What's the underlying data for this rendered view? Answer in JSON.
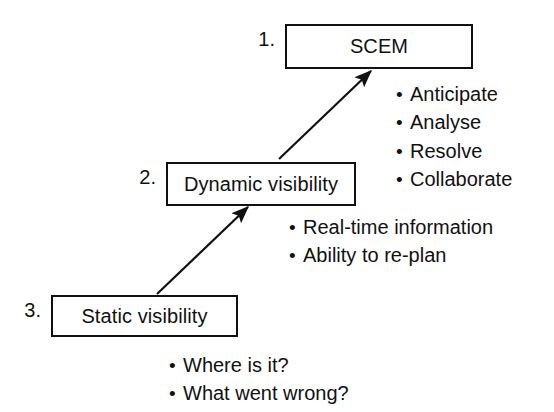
{
  "diagram": {
    "type": "flow-escalation",
    "background_color": "#ffffff",
    "line_color": "#111111",
    "text_color": "#111111",
    "nodes": [
      {
        "step": "1.",
        "label": "SCEM",
        "box": {
          "x": 285,
          "y": 24,
          "w": 188,
          "h": 45
        },
        "step_pos": {
          "x": 240,
          "y": 28
        }
      },
      {
        "step": "2.",
        "label": "Dynamic visibility",
        "box": {
          "x": 166,
          "y": 162,
          "w": 190,
          "h": 44
        },
        "step_pos": {
          "x": 122,
          "y": 166
        }
      },
      {
        "step": "3.",
        "label": "Static visibility",
        "box": {
          "x": 51,
          "y": 295,
          "w": 187,
          "h": 42
        },
        "step_pos": {
          "x": 6,
          "y": 299
        }
      }
    ],
    "arrows": [
      {
        "from": "Dynamic visibility",
        "to": "SCEM",
        "x1": 279,
        "y1": 159,
        "x2": 371,
        "y2": 71
      },
      {
        "from": "Static visibility",
        "to": "Dynamic visibility",
        "x1": 157,
        "y1": 294,
        "x2": 248,
        "y2": 207
      }
    ],
    "bullet_groups": [
      {
        "name": "scem-capabilities",
        "pos": {
          "x": 396,
          "y": 80
        },
        "items": [
          "Anticipate",
          "Analyse",
          "Resolve",
          "Collaborate"
        ]
      },
      {
        "name": "dynamic-visibility-attributes",
        "pos": {
          "x": 289,
          "y": 213
        },
        "items": [
          "Real-time information",
          "Ability to re-plan"
        ]
      },
      {
        "name": "static-visibility-questions",
        "pos": {
          "x": 169,
          "y": 351
        },
        "items": [
          "Where is it?",
          "What went wrong?"
        ]
      }
    ],
    "bullet_glyph": "•"
  }
}
